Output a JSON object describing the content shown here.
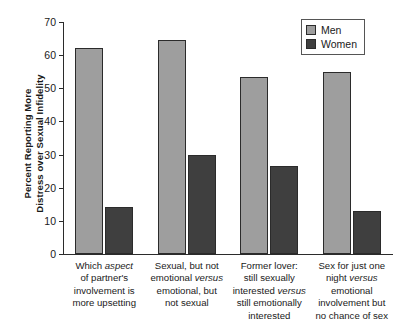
{
  "chart_data": {
    "type": "bar",
    "title": "",
    "xlabel": "",
    "ylabel": "Percent Reporting More Distress over Sexual Infidelity",
    "ylabel_lines": [
      "Percent Reporting More",
      "Distress over Sexual Infidelity"
    ],
    "ylim": [
      0,
      70
    ],
    "yticks": [
      0,
      10,
      20,
      30,
      40,
      50,
      60,
      70
    ],
    "ytick_labels": [
      "0",
      "10",
      "20",
      "30",
      "40",
      "50",
      "60",
      "70"
    ],
    "grid": false,
    "legend_position": "upper right",
    "categories": [
      "Which aspect of partner's involvement is more upsetting",
      "Sexual, but not emotional versus emotional, but not sexual",
      "Former lover: still sexually interested versus still emotionally interested",
      "Sex for just one night versus emotional involvement but no chance of sex"
    ],
    "category_lines": [
      [
        [
          {
            "t": "Which ",
            "i": false
          },
          {
            "t": "aspect",
            "i": true
          }
        ],
        [
          {
            "t": "of partner's",
            "i": false
          }
        ],
        [
          {
            "t": "involvement is",
            "i": false
          }
        ],
        [
          {
            "t": "more upsetting",
            "i": false
          }
        ]
      ],
      [
        [
          {
            "t": "Sexual, but not",
            "i": false
          }
        ],
        [
          {
            "t": "emotional ",
            "i": false
          },
          {
            "t": "versus",
            "i": true
          }
        ],
        [
          {
            "t": "emotional, but",
            "i": false
          }
        ],
        [
          {
            "t": "not sexual",
            "i": false
          }
        ]
      ],
      [
        [
          {
            "t": "Former lover:",
            "i": false
          }
        ],
        [
          {
            "t": "still sexually",
            "i": false
          }
        ],
        [
          {
            "t": "interested ",
            "i": false
          },
          {
            "t": "versus",
            "i": true
          }
        ],
        [
          {
            "t": "still emotionally",
            "i": false
          }
        ],
        [
          {
            "t": "interested",
            "i": false
          }
        ]
      ],
      [
        [
          {
            "t": "Sex for just one",
            "i": false
          }
        ],
        [
          {
            "t": "night ",
            "i": false
          },
          {
            "t": "versus",
            "i": true
          }
        ],
        [
          {
            "t": "emotional",
            "i": false
          }
        ],
        [
          {
            "t": "involvement but",
            "i": false
          }
        ],
        [
          {
            "t": "no chance of sex",
            "i": false
          }
        ]
      ]
    ],
    "series": [
      {
        "name": "Men",
        "color": "#9e9e9e",
        "values": [
          62.3,
          64.5,
          53.5,
          55.0
        ]
      },
      {
        "name": "Women",
        "color": "#3f3f3f",
        "values": [
          14.3,
          30.0,
          26.5,
          13.0
        ]
      }
    ]
  },
  "legend": {
    "items": [
      {
        "label": "Men"
      },
      {
        "label": "Women"
      }
    ]
  },
  "colors": {
    "men": "#9e9e9e",
    "women": "#3f3f3f",
    "axis": "#2b2b2b",
    "background": "#ffffff"
  }
}
